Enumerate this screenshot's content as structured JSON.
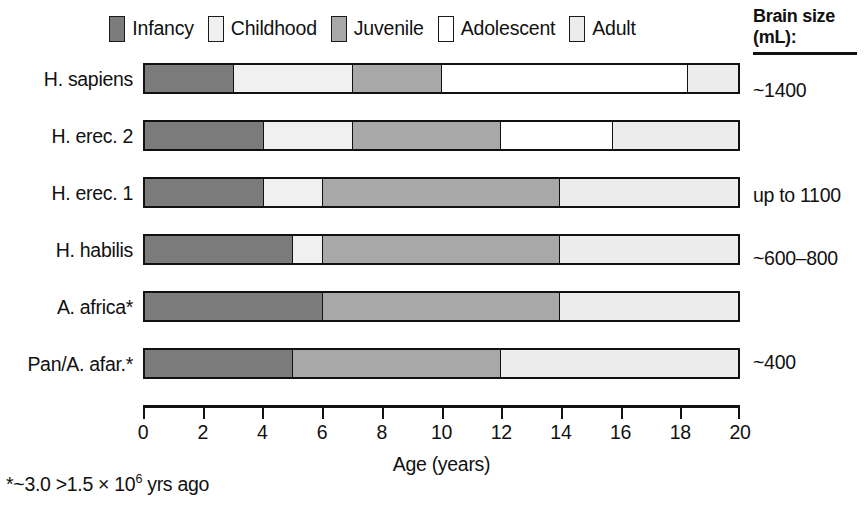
{
  "legend": {
    "items": [
      {
        "label": "Infancy",
        "key": "infancy",
        "color": "#7b7b7b"
      },
      {
        "label": "Childhood",
        "key": "childhood",
        "color": "#f0f0f0"
      },
      {
        "label": "Juvenile",
        "key": "juvenile",
        "color": "#a8a8a8"
      },
      {
        "label": "Adolescent",
        "key": "adolescent",
        "color": "#ffffff"
      },
      {
        "label": "Adult",
        "key": "adult",
        "color": "#ececec"
      }
    ]
  },
  "brain_header": {
    "line1": "Brain size",
    "line2": "(mL):"
  },
  "axis": {
    "title": "Age (years)",
    "ticks": [
      {
        "value": 0,
        "label": "0"
      },
      {
        "value": 2,
        "label": "2"
      },
      {
        "value": 4,
        "label": "4"
      },
      {
        "value": 6,
        "label": "6"
      },
      {
        "value": 8,
        "label": "8"
      },
      {
        "value": 10,
        "label": "10"
      },
      {
        "value": 12,
        "label": "12"
      },
      {
        "value": 14,
        "label": "14"
      },
      {
        "value": 16,
        "label": "16"
      },
      {
        "value": 18,
        "label": "18"
      },
      {
        "value": 20,
        "label": "20"
      }
    ]
  },
  "footnote": {
    "prefix": "*~3.0 >1.5 × 10",
    "exponent": "6",
    "suffix": " yrs ago"
  },
  "brain_values": [
    {
      "text": "~1400",
      "top": 80
    },
    {
      "text": "up to 1100",
      "top": 185
    },
    {
      "text": "~600–800",
      "top": 248
    },
    {
      "text": "~400",
      "top": 352
    }
  ],
  "chart_data": {
    "type": "bar",
    "orientation": "horizontal",
    "subtype": "stacked-timeline",
    "xlabel": "Age (years)",
    "ylabel": "",
    "xlim": [
      0,
      20
    ],
    "grid": false,
    "legend_position": "top",
    "stage_order": [
      "infancy",
      "childhood",
      "juvenile",
      "adolescent",
      "adult"
    ],
    "stage_colors": {
      "infancy": "#7b7b7b",
      "childhood": "#f0f0f0",
      "juvenile": "#a8a8a8",
      "adolescent": "#ffffff",
      "adult": "#ececec"
    },
    "categories": [
      "H. sapiens",
      "H. erec. 2",
      "H. erec. 1",
      "H. habilis",
      "A. africa*",
      "Pan/A. afar.*"
    ],
    "brain_size_mL": [
      "~1400",
      "up to 1100",
      "up to 1100",
      "~600–800",
      "~400",
      "~400"
    ],
    "rows": [
      {
        "label": "H. sapiens",
        "top": 62,
        "segments": [
          {
            "stage": "infancy",
            "start": 0,
            "end": 3.0
          },
          {
            "stage": "childhood",
            "start": 3.0,
            "end": 7.0
          },
          {
            "stage": "juvenile",
            "start": 7.0,
            "end": 10.0
          },
          {
            "stage": "adolescent",
            "start": 10.0,
            "end": 18.3
          },
          {
            "stage": "adult",
            "start": 18.3,
            "end": 20.0
          }
        ]
      },
      {
        "label": "H. erec. 2",
        "top": 119,
        "segments": [
          {
            "stage": "infancy",
            "start": 0,
            "end": 4.0
          },
          {
            "stage": "childhood",
            "start": 4.0,
            "end": 7.0
          },
          {
            "stage": "juvenile",
            "start": 7.0,
            "end": 12.0
          },
          {
            "stage": "adolescent",
            "start": 12.0,
            "end": 15.8
          },
          {
            "stage": "adult",
            "start": 15.8,
            "end": 20.0
          }
        ]
      },
      {
        "label": "H. erec. 1",
        "top": 176,
        "segments": [
          {
            "stage": "infancy",
            "start": 0,
            "end": 4.0
          },
          {
            "stage": "childhood",
            "start": 4.0,
            "end": 6.0
          },
          {
            "stage": "juvenile",
            "start": 6.0,
            "end": 14.0
          },
          {
            "stage": "adult",
            "start": 14.0,
            "end": 20.0
          }
        ]
      },
      {
        "label": "H. habilis",
        "top": 233,
        "segments": [
          {
            "stage": "infancy",
            "start": 0,
            "end": 5.0
          },
          {
            "stage": "childhood",
            "start": 5.0,
            "end": 6.0
          },
          {
            "stage": "juvenile",
            "start": 6.0,
            "end": 14.0
          },
          {
            "stage": "adult",
            "start": 14.0,
            "end": 20.0
          }
        ]
      },
      {
        "label": "A. africa*",
        "top": 290,
        "segments": [
          {
            "stage": "infancy",
            "start": 0,
            "end": 6.0
          },
          {
            "stage": "juvenile",
            "start": 6.0,
            "end": 14.0
          },
          {
            "stage": "adult",
            "start": 14.0,
            "end": 20.0
          }
        ]
      },
      {
        "label": "Pan/A. afar.*",
        "top": 347,
        "segments": [
          {
            "stage": "infancy",
            "start": 0,
            "end": 5.0
          },
          {
            "stage": "juvenile",
            "start": 5.0,
            "end": 12.0
          },
          {
            "stage": "adult",
            "start": 12.0,
            "end": 20.0
          }
        ]
      }
    ]
  }
}
